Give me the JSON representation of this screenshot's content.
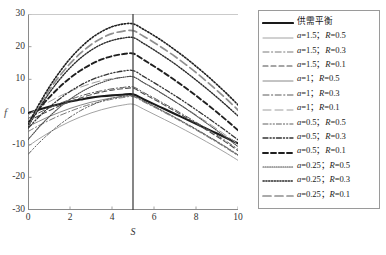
{
  "chart_data": {
    "type": "line",
    "title": "",
    "xlabel": "S",
    "ylabel": "f",
    "xlim": [
      0,
      10
    ],
    "ylim": [
      -30,
      30
    ],
    "xticks": [
      "0",
      "2",
      "4",
      "6",
      "8",
      "10"
    ],
    "xtick_values": [
      0,
      2,
      4,
      6,
      8,
      10
    ],
    "yticks": [
      "30",
      "20",
      "10",
      "0",
      "-10",
      "-20",
      "-30"
    ],
    "ytick_values": [
      30,
      20,
      10,
      0,
      -10,
      -20,
      -30
    ],
    "grid": false,
    "legend_position": "right-outside",
    "annotations": [
      {
        "name": "equilibrium-vline",
        "type": "vline",
        "x": 5,
        "y_from": -30,
        "y_to": 30,
        "color": "#444444"
      }
    ],
    "x": [
      0,
      0.5,
      1,
      1.5,
      2,
      2.5,
      3,
      3.5,
      4,
      4.5,
      5,
      5.5,
      6,
      6.5,
      7,
      7.5,
      8,
      8.5,
      9,
      9.5,
      10
    ],
    "series": [
      {
        "name": "供需平衡",
        "a": null,
        "R": null,
        "style": "solid",
        "width": 2.1,
        "color": "#1a1a1a",
        "values": [
          -0.3,
          0.7,
          1.6,
          2.4,
          3.2,
          3.8,
          4.4,
          4.8,
          5.1,
          5.3,
          5.4,
          3.9,
          2.4,
          0.9,
          -0.6,
          -2.1,
          -3.6,
          -5.1,
          -6.6,
          -8.1,
          -9.6
        ]
      },
      {
        "name": "a=1.5; R=0.5",
        "a": 1.5,
        "R": 0.5,
        "style": "solid",
        "width": 0.8,
        "color": "#8c8c8c",
        "values": [
          -10.5,
          -8.3,
          -6.3,
          -4.5,
          -2.9,
          -1.5,
          -0.3,
          0.7,
          1.5,
          2.1,
          2.4,
          0.9,
          -0.7,
          -2.3,
          -3.9,
          -5.6,
          -7.3,
          -9.1,
          -10.9,
          -12.8,
          -14.8
        ]
      },
      {
        "name": "a=1.5; R=0.3",
        "a": 1.5,
        "R": 0.3,
        "style": "dashdot",
        "width": 0.9,
        "color": "#6b6b6b",
        "values": [
          -6.0,
          -4.2,
          -2.6,
          -1.1,
          0.2,
          1.4,
          2.4,
          3.2,
          3.9,
          4.4,
          4.7,
          3.1,
          1.5,
          -0.2,
          -1.9,
          -3.7,
          -5.5,
          -7.4,
          -9.3,
          -11.3,
          -13.4
        ]
      },
      {
        "name": "a=1.5; R=0.1",
        "a": 1.5,
        "R": 0.1,
        "style": "dashed",
        "width": 1.1,
        "color": "#4d4d4d",
        "values": [
          -3.0,
          -1.2,
          0.4,
          1.9,
          3.2,
          4.3,
          5.3,
          6.1,
          6.7,
          7.1,
          7.3,
          5.6,
          3.9,
          2.1,
          0.3,
          -1.6,
          -3.5,
          -5.5,
          -7.5,
          -9.6,
          -11.8
        ]
      },
      {
        "name": "a=1; R=0.5",
        "a": 1,
        "R": 0.5,
        "style": "solid",
        "width": 0.9,
        "color": "#7a7a7a",
        "values": [
          -4.5,
          -2.9,
          -1.4,
          -0.1,
          1.1,
          2.1,
          3.0,
          3.7,
          4.3,
          4.7,
          4.9,
          3.3,
          1.7,
          0.0,
          -1.7,
          -3.5,
          -5.3,
          -7.2,
          -9.1,
          -11.1,
          -13.2
        ]
      },
      {
        "name": "a=1; R=0.3",
        "a": 1,
        "R": 0.3,
        "style": "dashdot",
        "width": 1.0,
        "color": "#5a5a5a",
        "values": [
          -2.0,
          -0.3,
          1.2,
          2.6,
          3.8,
          4.9,
          5.8,
          6.5,
          7.1,
          7.5,
          7.7,
          6.0,
          4.3,
          2.5,
          0.7,
          -1.2,
          -3.1,
          -5.1,
          -7.1,
          -9.2,
          -11.4
        ]
      },
      {
        "name": "a=1; R=0.1",
        "a": 1,
        "R": 0.1,
        "style": "longdash",
        "width": 1.0,
        "color": "#9e9e9e",
        "values": [
          -1.0,
          1.2,
          3.1,
          4.8,
          6.3,
          7.6,
          8.7,
          9.6,
          10.2,
          10.6,
          10.8,
          9.0,
          7.1,
          5.2,
          3.2,
          1.2,
          -0.9,
          -3.0,
          -5.2,
          -7.5,
          -9.8
        ]
      },
      {
        "name": "a=0.5; R=0.5",
        "a": 0.5,
        "R": 0.5,
        "style": "dashdotdot",
        "width": 1.0,
        "color": "#5f5f5f",
        "values": [
          -13.0,
          -9.6,
          -6.6,
          -3.9,
          -1.6,
          0.4,
          2.0,
          3.3,
          4.2,
          4.8,
          5.0,
          3.4,
          1.8,
          0.1,
          -1.6,
          -3.4,
          -5.2,
          -7.1,
          -9.0,
          -11.0,
          -13.1
        ]
      },
      {
        "name": "a=0.5; R=0.3",
        "a": 0.5,
        "R": 0.3,
        "style": "dashdotdot",
        "width": 1.3,
        "color": "#333333",
        "values": [
          -5.0,
          -1.6,
          1.4,
          4.0,
          6.3,
          8.2,
          9.8,
          11.0,
          11.9,
          12.5,
          12.7,
          10.9,
          9.0,
          7.0,
          5.0,
          2.9,
          0.7,
          -1.5,
          -3.8,
          -6.1,
          -8.5
        ]
      },
      {
        "name": "a=0.5; R=0.1",
        "a": 0.5,
        "R": 0.1,
        "style": "dashed",
        "width": 1.9,
        "color": "#1f1f1f",
        "values": [
          -3.5,
          0.7,
          4.4,
          7.6,
          10.4,
          12.7,
          14.6,
          16.1,
          17.1,
          17.7,
          17.9,
          16.0,
          14.0,
          11.9,
          9.7,
          7.4,
          5.0,
          2.5,
          -0.1,
          -2.8,
          -5.6
        ]
      },
      {
        "name": "a=0.25; R=0.5",
        "a": 0.25,
        "R": 0.5,
        "style": "dotted",
        "width": 1.1,
        "color": "#4a4a4a",
        "values": [
          -8.5,
          -4.8,
          -1.5,
          1.4,
          3.9,
          6.0,
          7.7,
          9.0,
          10.0,
          10.6,
          10.8,
          9.0,
          7.2,
          5.2,
          3.2,
          1.1,
          -1.1,
          -3.4,
          -5.7,
          -8.1,
          -10.6
        ]
      },
      {
        "name": "a=0.25; R=0.3",
        "a": 0.25,
        "R": 0.3,
        "style": "dotted",
        "width": 1.4,
        "color": "#2a2a2a",
        "values": [
          -4.5,
          0.9,
          5.7,
          9.9,
          13.5,
          16.5,
          18.9,
          20.7,
          21.9,
          22.6,
          22.8,
          21.0,
          19.0,
          16.9,
          14.7,
          12.3,
          9.8,
          7.2,
          4.5,
          1.7,
          -1.2
        ]
      },
      {
        "name": "a=0.25; R=0.1",
        "a": 0.25,
        "R": 0.1,
        "style": "longdash",
        "width": 1.7,
        "color": "#8f8f8f",
        "values": [
          -4.0,
          1.6,
          6.6,
          11.0,
          14.8,
          18.0,
          20.6,
          22.6,
          24.0,
          24.7,
          24.9,
          23.2,
          21.3,
          19.2,
          17.0,
          14.6,
          12.1,
          9.4,
          6.6,
          3.7,
          0.6
        ]
      },
      {
        "name": "a=0.25; R=0.1-upper",
        "a": 0.25,
        "R": 0.1,
        "style": "dotted",
        "width": 1.6,
        "color": "#1f1f1f",
        "values": [
          -3.8,
          2.1,
          7.5,
          12.2,
          16.3,
          19.7,
          22.5,
          24.6,
          26.1,
          26.9,
          27.0,
          25.3,
          23.4,
          21.3,
          19.0,
          16.6,
          14.0,
          11.3,
          8.4,
          5.4,
          2.2
        ]
      }
    ]
  },
  "legend": {
    "entries": [
      {
        "label": "供需平衡",
        "style": "solid",
        "width": 2.1,
        "color": "#1a1a1a"
      },
      {
        "label": "a=1.5;  R=0.5",
        "style": "solid",
        "width": 0.8,
        "color": "#8c8c8c"
      },
      {
        "label": "a=1.5;  R=0.3",
        "style": "dashdot",
        "width": 0.9,
        "color": "#6b6b6b"
      },
      {
        "label": "a=1.5;  R=0.1",
        "style": "dashed",
        "width": 1.1,
        "color": "#4d4d4d"
      },
      {
        "label": "a=1;  R=0.5",
        "style": "solid",
        "width": 0.9,
        "color": "#7a7a7a"
      },
      {
        "label": "a=1;  R=0.3",
        "style": "dashdot",
        "width": 1.0,
        "color": "#5a5a5a"
      },
      {
        "label": "a=1;  R=0.1",
        "style": "longdash",
        "width": 1.0,
        "color": "#9e9e9e"
      },
      {
        "label": "a=0.5;  R=0.5",
        "style": "dashdotdot",
        "width": 1.0,
        "color": "#5f5f5f"
      },
      {
        "label": "a=0.5;  R=0.3",
        "style": "dashdotdot",
        "width": 1.3,
        "color": "#333333"
      },
      {
        "label": "a=0.5;  R=0.1",
        "style": "dashed",
        "width": 1.9,
        "color": "#1f1f1f"
      },
      {
        "label": "a=0.25;  R=0.5",
        "style": "dotted",
        "width": 1.1,
        "color": "#4a4a4a"
      },
      {
        "label": "a=0.25;  R=0.3",
        "style": "dotted",
        "width": 1.4,
        "color": "#2a2a2a"
      },
      {
        "label": "a=0.25;  R=0.1",
        "style": "longdash",
        "width": 1.7,
        "color": "#8f8f8f"
      }
    ]
  }
}
